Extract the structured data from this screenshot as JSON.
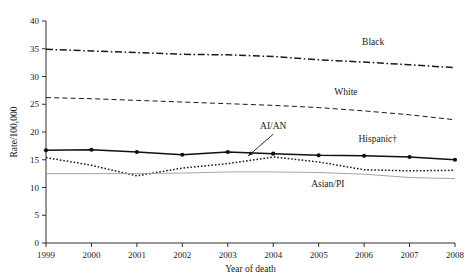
{
  "figure": {
    "background": "#ffffff",
    "ink_color": "#1a1a1a"
  },
  "chart_data": {
    "type": "line",
    "title": "",
    "subtitle": "",
    "xlabel": "Year of death",
    "ylabel": "Rate/100,000",
    "x": [
      1999,
      2000,
      2001,
      2002,
      2003,
      2004,
      2005,
      2006,
      2007,
      2008
    ],
    "xtick_labels": [
      "1999",
      "2000",
      "2001",
      "2002",
      "2003",
      "2004",
      "2005",
      "2006",
      "2007",
      "2008"
    ],
    "ytick_labels": [
      "0",
      "5",
      "10",
      "15",
      "20",
      "25",
      "30",
      "35",
      "40"
    ],
    "yticks": [
      0,
      5,
      10,
      15,
      20,
      25,
      30,
      35,
      40
    ],
    "xlim": [
      1999,
      2008
    ],
    "ylim": [
      0,
      40
    ],
    "grid": false,
    "legend_position": "inline-labels",
    "series": [
      {
        "name": "Black",
        "label": "Black",
        "style": "dash-dot",
        "color": "#1a1a1a",
        "width": 1.5,
        "markers": false,
        "values": [
          34.9,
          34.6,
          34.3,
          34.0,
          33.9,
          33.6,
          33.0,
          32.6,
          32.1,
          31.6
        ],
        "label_x": 2006.2,
        "label_y": 35.6
      },
      {
        "name": "White",
        "label": "White",
        "style": "dashed",
        "color": "#1a1a1a",
        "width": 1.0,
        "markers": false,
        "values": [
          26.2,
          26.0,
          25.7,
          25.4,
          25.1,
          24.8,
          24.4,
          23.8,
          23.1,
          22.2
        ],
        "label_x": 2005.6,
        "label_y": 26.6
      },
      {
        "name": "Hispanic",
        "label": "Hispanic†",
        "style": "solid",
        "color": "#111111",
        "width": 1.5,
        "markers": true,
        "values": [
          16.7,
          16.8,
          16.4,
          15.9,
          16.4,
          16.1,
          15.8,
          15.7,
          15.5,
          15.0
        ],
        "label_x": 2006.3,
        "label_y": 18.2
      },
      {
        "name": "AI/AN",
        "label": "AI/AN",
        "style": "dotted",
        "color": "#1a1a1a",
        "width": 1.5,
        "markers": false,
        "values": [
          15.4,
          14.0,
          12.1,
          13.5,
          14.3,
          15.5,
          14.6,
          13.2,
          13.0,
          13.1
        ],
        "label_x": 2004.0,
        "label_y": 20.6,
        "annotation": {
          "arrow_from_x": 2004.0,
          "arrow_from_y": 19.6,
          "arrow_to_x": 2003.45,
          "arrow_to_y": 15.7
        }
      },
      {
        "name": "Asian/PI",
        "label": "Asian/PI",
        "style": "solid",
        "color": "#9a9a9a",
        "width": 0.9,
        "markers": false,
        "values": [
          12.5,
          12.5,
          12.5,
          12.6,
          12.8,
          12.8,
          12.7,
          12.4,
          11.8,
          11.6
        ],
        "label_x": 2005.2,
        "label_y": 10.1
      }
    ]
  }
}
